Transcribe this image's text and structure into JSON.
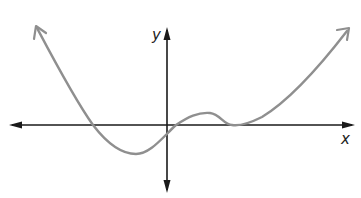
{
  "figure": {
    "type": "function-graph",
    "axes": {
      "x_label": "x",
      "y_label": "y",
      "color": "#1a1a1a"
    },
    "curve": {
      "color": "#8f8f8f",
      "description": "Polynomial-like curve: falls from upper left, crosses x-axis left of origin, reaches a local minimum below the axis, rises through the x-axis just right of the origin, forms a small local maximum, returns to touch the x-axis tangentially (double root), then rises to the upper right.",
      "features": [
        {
          "name": "left-end",
          "behavior": "rises to upper left (arrow)"
        },
        {
          "name": "x-intercept-1",
          "position": "negative x"
        },
        {
          "name": "local-minimum",
          "position": "negative x, below axis"
        },
        {
          "name": "x-intercept-2",
          "position": "small positive x"
        },
        {
          "name": "local-maximum",
          "position": "positive x, slightly above axis"
        },
        {
          "name": "tangent-root",
          "position": "positive x, touches axis"
        },
        {
          "name": "right-end",
          "behavior": "rises to upper right (arrow)"
        }
      ]
    }
  }
}
